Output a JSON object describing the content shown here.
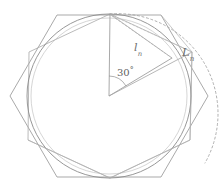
{
  "figure": {
    "colors": {
      "outer_hexagon": "#9a9a9a",
      "inner_hexagon": "#a8a8a8",
      "circle": "#8c8c8c",
      "dashed_arc": "#a0a0a0",
      "radial_lines": "#9a9a9a",
      "chord_lines": "#a5a5a5",
      "label_text": "#6e6e6e",
      "background": "#ffffff"
    },
    "geometry": {
      "center": {
        "x": 109,
        "y": 96
      },
      "inscribed_circle_radius": 82,
      "outer_hexagon_circumradius": 95,
      "dashed_arc_radius": 100,
      "apex": {
        "x": 110,
        "y": 14
      },
      "right_vertex": {
        "x": 172,
        "y": 58
      },
      "angle_degrees": 30
    },
    "labels": {
      "small_l": {
        "base": "l",
        "subscript": "n"
      },
      "big_l": {
        "base": "L",
        "subscript": "n"
      },
      "angle": {
        "value": "30",
        "unit": "°"
      }
    }
  }
}
